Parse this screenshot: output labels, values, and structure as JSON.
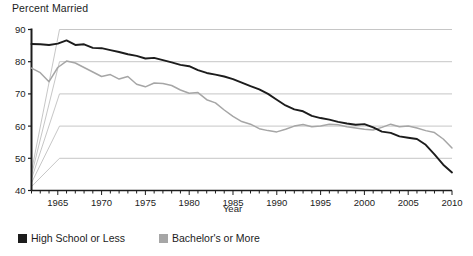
{
  "chart_data": {
    "type": "line",
    "title": "Percent Married",
    "xlabel": "Year",
    "ylabel": "",
    "xlim": [
      1962,
      2010
    ],
    "ylim": [
      40,
      90
    ],
    "yticks": [
      40,
      50,
      60,
      70,
      80,
      90
    ],
    "xticks": [
      1965,
      1970,
      1975,
      1980,
      1985,
      1990,
      1995,
      2000,
      2005,
      2010
    ],
    "xtick_labels": [
      "1965",
      "1970",
      "1975",
      "1980",
      "1985",
      "1990",
      "1995",
      "2000",
      "2005",
      "2010"
    ],
    "ytick_labels": [
      "40",
      "50",
      "60",
      "70",
      "80",
      "90"
    ],
    "xtick_minor_step": 1,
    "grid": true,
    "grid_axis": "y",
    "legend_position": "bottom-left",
    "x": [
      1962,
      1963,
      1964,
      1965,
      1966,
      1967,
      1968,
      1969,
      1970,
      1971,
      1972,
      1973,
      1974,
      1975,
      1976,
      1977,
      1978,
      1979,
      1980,
      1981,
      1982,
      1983,
      1984,
      1985,
      1986,
      1987,
      1988,
      1989,
      1990,
      1991,
      1992,
      1993,
      1994,
      1995,
      1996,
      1997,
      1998,
      1999,
      2000,
      2001,
      2002,
      2003,
      2004,
      2005,
      2006,
      2007,
      2008,
      2009,
      2010
    ],
    "series": [
      {
        "name": "High School or Less",
        "color": "#1c1c1c",
        "values": [
          85.5,
          85.4,
          85.2,
          85.6,
          86.6,
          85.2,
          85.4,
          84.3,
          84.2,
          83.6,
          83.0,
          82.3,
          81.8,
          81.0,
          81.2,
          80.5,
          79.8,
          79.0,
          78.6,
          77.4,
          76.5,
          76.0,
          75.4,
          74.6,
          73.5,
          72.4,
          71.4,
          70.0,
          68.2,
          66.4,
          65.2,
          64.6,
          63.2,
          62.5,
          62.0,
          61.3,
          60.8,
          60.4,
          60.6,
          59.6,
          58.3,
          57.9,
          56.8,
          56.4,
          56.0,
          54.2,
          51.2,
          48.0,
          45.6
        ]
      },
      {
        "name": "Bachelor's or More",
        "color": "#a6a6a6",
        "values": [
          78.0,
          76.6,
          73.8,
          78.2,
          80.2,
          79.6,
          78.2,
          76.8,
          75.4,
          76.0,
          74.6,
          75.4,
          73.0,
          72.2,
          73.4,
          73.2,
          72.6,
          71.2,
          70.2,
          70.4,
          68.2,
          67.2,
          65.0,
          63.0,
          61.4,
          60.6,
          59.2,
          58.6,
          58.2,
          59.0,
          60.0,
          60.5,
          59.8,
          60.0,
          60.6,
          60.4,
          59.8,
          59.4,
          59.0,
          58.8,
          59.6,
          60.6,
          59.8,
          60.0,
          59.4,
          58.6,
          58.0,
          56.0,
          53.2
        ]
      }
    ]
  },
  "legend": {
    "items": [
      {
        "label": "High School or Less",
        "color": "#1c1c1c"
      },
      {
        "label": "Bachelor's or More",
        "color": "#a6a6a6"
      }
    ]
  },
  "colors": {
    "axis": "#1c1c1c",
    "grid": "#b8b8b8",
    "background": "#ffffff"
  }
}
